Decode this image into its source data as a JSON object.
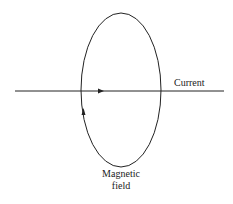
{
  "diagram": {
    "labels": {
      "current": "Current",
      "magnetic_field_line1": "Magnetic",
      "magnetic_field_line2": "field"
    },
    "colors": {
      "stroke": "#222222",
      "background": "#ffffff"
    }
  }
}
